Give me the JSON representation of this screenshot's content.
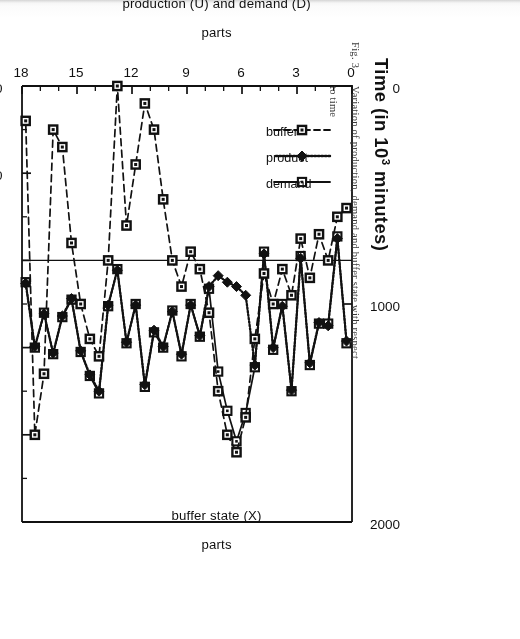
{
  "figure": {
    "fig_number": "Fig. 3.",
    "caption_line1": "Variation of production, demand and buffer state with respect",
    "caption_line2": "to time"
  },
  "chart_data": {
    "type": "line",
    "title": "",
    "xlabel": "Time (in 10^3 minutes)",
    "xlabel_prefix": "Time (in 10",
    "xlabel_exponent": "3",
    "xlabel_suffix": " minutes)",
    "ylabel_left": "production (U) and demand (D)\nparts",
    "ylabel_left_line1": "production (U) and demand (D)",
    "ylabel_left_line2": "parts",
    "ylabel_right": "buffer state (X)\nparts",
    "ylabel_right_line1": "buffer state (X)",
    "ylabel_right_line2": "parts",
    "xlim": [
      0,
      18
    ],
    "xticks": [
      0,
      3,
      6,
      9,
      12,
      15,
      18
    ],
    "xtick_labels": [
      "0",
      "3",
      "6",
      "9",
      "12",
      "15",
      "18"
    ],
    "x_minor_step": 1,
    "ylim_left": [
      0,
      2000
    ],
    "yticks_left": [
      0,
      1000,
      2000
    ],
    "ytick_labels_left": [
      "0",
      "1000",
      "2000"
    ],
    "ylim_right": [
      -40,
      60
    ],
    "yticks_right": [
      -40,
      -20,
      0,
      20,
      40,
      60
    ],
    "ytick_labels_right": [
      "-40",
      "-20",
      "0",
      "20",
      "40",
      "60"
    ],
    "grid": false,
    "legend_position": "upper-left-inside",
    "colors": {
      "ink": "#111111",
      "paper": "#ffffff"
    },
    "series": [
      {
        "name": "demand",
        "axis": "left",
        "marker": "open-square",
        "line": "solid",
        "x": [
          0.3,
          0.8,
          1.3,
          1.8,
          2.3,
          2.8,
          3.3,
          3.8,
          4.3,
          4.8,
          5.3,
          5.8,
          6.3,
          6.8,
          7.3,
          7.8,
          8.3,
          8.8,
          9.3,
          9.8,
          10.3,
          10.8,
          11.3,
          11.8,
          12.3,
          12.8,
          13.3,
          13.8,
          14.3,
          14.8,
          15.3,
          15.8,
          16.3,
          16.8,
          17.3,
          17.8
        ],
        "y": [
          1180,
          690,
          1090,
          1090,
          1280,
          780,
          1400,
          1000,
          1210,
          760,
          1290,
          1500,
          1630,
          1490,
          1310,
          930,
          1150,
          1000,
          1240,
          1030,
          1200,
          1130,
          1380,
          1000,
          1180,
          840,
          1010,
          1410,
          1330,
          1220,
          980,
          1060,
          1230,
          1040,
          1200,
          900
        ]
      },
      {
        "name": "product",
        "axis": "left",
        "marker": "filled-diamond",
        "line": "solid",
        "x": [
          0.3,
          0.8,
          1.3,
          1.8,
          2.3,
          2.8,
          3.3,
          3.8,
          4.3,
          4.8,
          5.3,
          5.8,
          6.3,
          6.8,
          7.3,
          7.8,
          8.3,
          8.8,
          9.3,
          9.8,
          10.3,
          10.8,
          11.3,
          11.8,
          12.3,
          12.8,
          13.3,
          13.8,
          14.3,
          14.8,
          15.3,
          15.8,
          16.3,
          16.8,
          17.3,
          17.8
        ],
        "y": [
          1170,
          700,
          1100,
          1085,
          1270,
          790,
          1395,
          1010,
          1200,
          770,
          1280,
          960,
          920,
          900,
          870,
          920,
          1145,
          1005,
          1230,
          1035,
          1195,
          1120,
          1370,
          1005,
          1175,
          845,
          1005,
          1400,
          1325,
          1215,
          975,
          1055,
          1225,
          1045,
          1195,
          905
        ]
      },
      {
        "name": "buffer",
        "axis": "right",
        "marker": "square",
        "line": "dashed",
        "x": [
          0.3,
          0.8,
          1.3,
          1.8,
          2.3,
          2.8,
          3.3,
          3.8,
          4.3,
          4.8,
          5.3,
          5.8,
          6.3,
          6.8,
          7.3,
          7.8,
          8.3,
          8.8,
          9.3,
          9.8,
          10.3,
          10.8,
          11.3,
          11.8,
          12.3,
          12.8,
          13.3,
          13.8,
          14.3,
          14.8,
          15.3,
          15.8,
          16.3,
          16.8,
          17.3,
          17.8
        ],
        "y": [
          -12,
          -10,
          0,
          -6,
          4,
          -5,
          8,
          2,
          10,
          3,
          18,
          36,
          44,
          40,
          30,
          12,
          2,
          -2,
          6,
          0,
          -14,
          -30,
          -36,
          -22,
          -8,
          -40,
          0,
          22,
          18,
          10,
          -4,
          -26,
          -30,
          26,
          40,
          -32
        ]
      }
    ],
    "legend": [
      {
        "label": "demand",
        "marker": "open-square",
        "line": "solid"
      },
      {
        "label": "product",
        "marker": "filled-diamond",
        "line": "solid"
      },
      {
        "label": "buffer",
        "marker": "square",
        "line": "dashed"
      }
    ]
  }
}
